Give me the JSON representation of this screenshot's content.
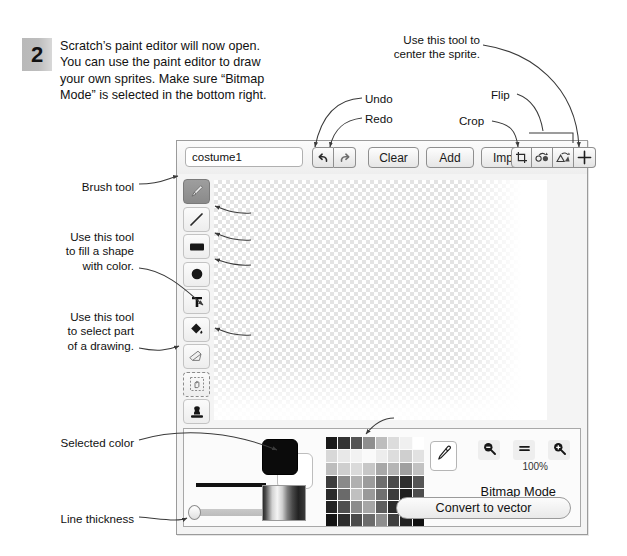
{
  "step": {
    "number": "2",
    "lines": [
      "Scratch’s paint editor will now open.",
      "You can use the paint editor to draw",
      "your own sprites. Make sure “Bitmap",
      "Mode” is selected in the bottom right."
    ]
  },
  "annotations": {
    "brush_tool": "Brush tool",
    "line_tool": "Line tool",
    "rectangle_tool": "Rectangle tool",
    "ellipse_tool": "Ellipse tool (oval)",
    "eraser": "Eraser",
    "fill_tool_l1": "Use this tool",
    "fill_tool_l2": "to fill a shape",
    "fill_tool_l3": "with color.",
    "select_tool_l1": "Use this tool",
    "select_tool_l2": "to select part",
    "select_tool_l3": "of a drawing.",
    "undo": "Undo",
    "redo": "Redo",
    "crop": "Crop",
    "flip": "Flip",
    "center_l1": "Use this tool to",
    "center_l2": "center the sprite.",
    "color_palette": "Color palette",
    "selected_color": "Selected color",
    "line_thickness": "Line thickness"
  },
  "editor": {
    "costume_name_value": "costume1",
    "costume_name_placeholder": "costume1",
    "toolbar_buttons": [
      {
        "label": "Clear",
        "name": "clear-button"
      },
      {
        "label": "Add",
        "name": "add-button"
      },
      {
        "label": "Import",
        "name": "import-button"
      }
    ],
    "icon_buttons": [
      {
        "icon": "undo-icon",
        "label": "Undo"
      },
      {
        "icon": "redo-icon",
        "label": "Redo"
      },
      {
        "icon": "crop-icon",
        "label": "Crop"
      },
      {
        "icon": "flip-horizontal-icon",
        "label": "Flip horizontal"
      },
      {
        "icon": "flip-vertical-icon",
        "label": "Flip vertical"
      },
      {
        "icon": "set-costume-center-icon",
        "label": "Set costume center"
      }
    ],
    "tools": [
      {
        "name": "brush-tool",
        "icon": "paintbrush-icon",
        "selected": true
      },
      {
        "name": "line-tool",
        "icon": "line-icon",
        "selected": false
      },
      {
        "name": "rectangle-tool",
        "icon": "rectangle-icon",
        "selected": false
      },
      {
        "name": "ellipse-tool",
        "icon": "ellipse-icon",
        "selected": false
      },
      {
        "name": "text-tool",
        "icon": "text-t-icon",
        "selected": false
      },
      {
        "name": "fill-tool",
        "icon": "paint-bucket-icon",
        "selected": false
      },
      {
        "name": "eraser-tool",
        "icon": "eraser-icon",
        "selected": false
      },
      {
        "name": "select-tool",
        "icon": "select-marquee-icon",
        "selected": false
      },
      {
        "name": "stamp-tool",
        "icon": "stamp-icon",
        "selected": false
      }
    ],
    "zoom": {
      "out_label": "−",
      "reset_label": "=",
      "in_label": "+",
      "percent": "100%"
    },
    "mode_label": "Bitmap Mode",
    "convert_label": "Convert to vector",
    "selected_color_hex": "#0b0b0b",
    "background_color_hex": "#ffffff",
    "palette_rows": [
      [
        "#1a1a1a",
        "#333333",
        "#555555",
        "#8f8f8f",
        "#bdbdbd",
        "#dcdcdc",
        "#f0f0f0",
        "#ffffff"
      ],
      [
        "#d8d8d8",
        "#e8e8e8",
        "#f2f2f2",
        "#fafafa",
        "#ededed",
        "#dddddd",
        "#cfcfcf",
        "#e2e2e2"
      ],
      [
        "#bdbdbd",
        "#cfcfcf",
        "#dadada",
        "#c7c7c7",
        "#a8a8a8",
        "#b5b5b5",
        "#a0a0a0",
        "#c2c2c2"
      ],
      [
        "#3d3d3d",
        "#8a8a8a",
        "#b0b0b0",
        "#9c9c9c",
        "#6e6e6e",
        "#4a4a4a",
        "#2e2e2e",
        "#565656"
      ],
      [
        "#2b2b2b",
        "#6a6a6a",
        "#c0c0c0",
        "#9a9a9a",
        "#707070",
        "#3c3c3c",
        "#1f1f1f",
        "#4d4d4d"
      ],
      [
        "#232323",
        "#4f4f4f",
        "#8c8c8c",
        "#a6a6a6",
        "#5e5e5e",
        "#2a2a2a",
        "#161616",
        "#3a3a3a"
      ],
      [
        "#141414",
        "#2c2c2c",
        "#4a4a4a",
        "#6c6c6c",
        "#8e8e8e",
        "#3f3f3f",
        "#222222",
        "#111111"
      ]
    ]
  }
}
